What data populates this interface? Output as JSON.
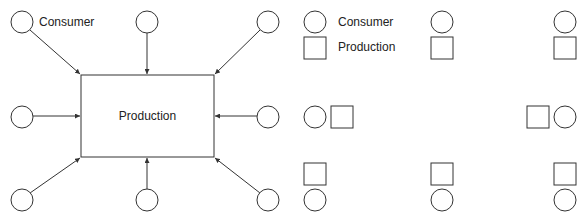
{
  "left_diagram": {
    "title": "Centralized production",
    "center_label": "Production",
    "consumer_label": "Consumer",
    "consumers": [
      {
        "id": "top-left"
      },
      {
        "id": "top-center"
      },
      {
        "id": "top-right"
      },
      {
        "id": "middle-left"
      },
      {
        "id": "middle-right"
      },
      {
        "id": "bottom-left"
      },
      {
        "id": "bottom-center"
      },
      {
        "id": "bottom-right"
      }
    ]
  },
  "right_diagram": {
    "title": "Distributed production",
    "legend": {
      "consumer_label": "Consumer",
      "production_label": "Production"
    },
    "pairs": [
      {
        "id": "top-left"
      },
      {
        "id": "top-center"
      },
      {
        "id": "top-right"
      },
      {
        "id": "middle-left"
      },
      {
        "id": "middle-right"
      },
      {
        "id": "bottom-left"
      },
      {
        "id": "bottom-center"
      },
      {
        "id": "bottom-right"
      }
    ]
  },
  "colors": {
    "stroke": "#333333",
    "background": "#ffffff"
  }
}
